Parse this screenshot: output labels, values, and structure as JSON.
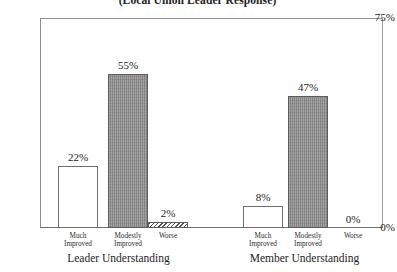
{
  "chart_data": {
    "type": "bar",
    "title": "(Local Union Leader Response)",
    "xlabel": "",
    "ylabel": "",
    "ylim": [
      0,
      75
    ],
    "grid": false,
    "legend": "none",
    "ytick_labels": [
      "0%",
      "75%"
    ],
    "categories": [
      "Much Improved",
      "Modestly Improved",
      "Worse"
    ],
    "groups": [
      {
        "name": "Leader Understanding",
        "values": [
          22,
          55,
          2
        ],
        "value_labels": [
          "22%",
          "55%",
          "2%"
        ],
        "styles": [
          "open",
          "solid",
          "hatched"
        ]
      },
      {
        "name": "Member Understanding",
        "values": [
          8,
          47,
          0
        ],
        "value_labels": [
          "8%",
          "47%",
          "0%"
        ],
        "styles": [
          "open",
          "solid",
          "empty"
        ]
      }
    ]
  },
  "axis": {
    "y_top_label": "75%",
    "y_zero_label": "0%"
  },
  "categories": {
    "much_improved_line1": "Much",
    "much_improved_line2": "Improved",
    "modestly_improved_line1": "Modestly",
    "modestly_improved_line2": "Improved",
    "worse": "Worse"
  },
  "colors": {
    "solid_bar_fill": "#8c8c8c",
    "open_bar_fill": "#ffffff",
    "bar_outline": "#5d5d5d",
    "frame": "#9a9a9a",
    "text": "#1d1d1d",
    "background": "#ffffff"
  }
}
